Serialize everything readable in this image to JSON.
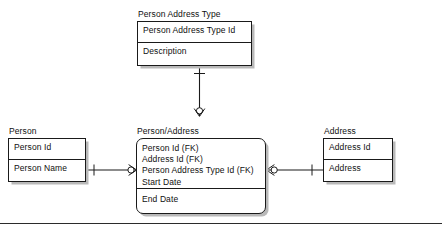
{
  "diagram": {
    "type": "entity-relationship-diagram",
    "notation": "crow's foot",
    "entities": [
      {
        "id": "person-address-type",
        "title": "Person Address Type",
        "groups": [
          {
            "attributes": [
              "Person Address Type Id"
            ]
          },
          {
            "attributes": [
              "Description"
            ]
          }
        ]
      },
      {
        "id": "person",
        "title": "Person",
        "groups": [
          {
            "attributes": [
              "Person Id"
            ]
          },
          {
            "attributes": [
              "Person Name"
            ]
          }
        ]
      },
      {
        "id": "person-address",
        "title": "Person/Address",
        "rounded": true,
        "groups": [
          {
            "attributes": [
              "Person Id (FK)",
              "Address Id (FK)",
              "Person Address Type Id (FK)",
              "Start Date"
            ]
          },
          {
            "attributes": [
              "End Date"
            ]
          }
        ]
      },
      {
        "id": "address",
        "title": "Address",
        "groups": [
          {
            "attributes": [
              "Address Id"
            ]
          },
          {
            "attributes": [
              "Address"
            ]
          }
        ]
      }
    ],
    "relationships": [
      {
        "id": "rel-person-to-personaddress",
        "from": "person",
        "to": "person-address",
        "from_cardinality": "one",
        "to_cardinality": "zero-or-many"
      },
      {
        "id": "rel-address-to-personaddress",
        "from": "address",
        "to": "person-address",
        "from_cardinality": "one",
        "to_cardinality": "zero-or-many"
      },
      {
        "id": "rel-persontype-to-personaddress",
        "from": "person-address-type",
        "to": "person-address",
        "from_cardinality": "one",
        "to_cardinality": "zero-or-many"
      }
    ]
  }
}
